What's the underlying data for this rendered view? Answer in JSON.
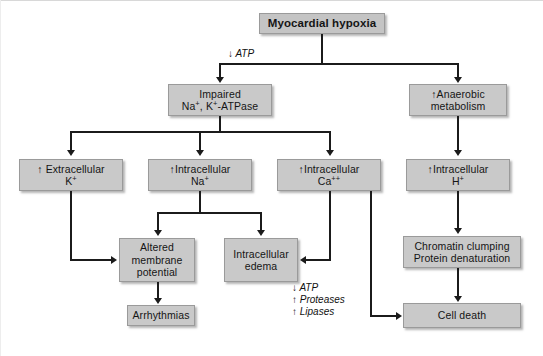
{
  "diagram": {
    "colors": {
      "node_fill": "#c9c9c9",
      "node_border": "#9a9a9a",
      "connector": "#1b1b1b",
      "background": "#ffffff"
    },
    "nodes": [
      {
        "id": "myocardial-hypoxia",
        "label": "Myocardial hypoxia",
        "bold": true
      },
      {
        "id": "impaired-atpase",
        "line1": "Impaired",
        "line2": "Na+, K+-ATPase"
      },
      {
        "id": "anaerobic-metabolism",
        "line1": "↑Anaerobic",
        "line2": "metabolism"
      },
      {
        "id": "extracellular-k",
        "line1": "↑ Extracellular",
        "line2": "K+"
      },
      {
        "id": "intracellular-na",
        "line1": "↑Intracellular",
        "line2": "Na+"
      },
      {
        "id": "intracellular-ca",
        "line1": "↑Intracellular",
        "line2": "Ca++"
      },
      {
        "id": "intracellular-h",
        "line1": "↑Intracellular",
        "line2": "H+"
      },
      {
        "id": "altered-membrane-potential",
        "line1": "Altered",
        "line2": "membrane",
        "line3": "potential"
      },
      {
        "id": "intracellular-edema",
        "line1": "Intracellular",
        "line2": "edema"
      },
      {
        "id": "chromatin-clumping",
        "line1": "Chromatin clumping",
        "line2": "Protein denaturation"
      },
      {
        "id": "arrhythmias",
        "label": "Arrhythmias"
      },
      {
        "id": "cell-death",
        "label": "Cell death"
      }
    ],
    "annotations": [
      {
        "id": "atp-drop",
        "text": "↓ ATP"
      },
      {
        "id": "ca-effects-line1",
        "text": "↓ ATP"
      },
      {
        "id": "ca-effects-line2",
        "text": "↑ Proteases"
      },
      {
        "id": "ca-effects-line3",
        "text": "↑ Lipases"
      }
    ]
  }
}
